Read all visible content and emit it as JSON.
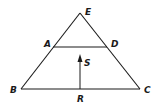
{
  "diagram": {
    "type": "geometry-figure",
    "stroke_color": "#1a1a1a",
    "background": "#ffffff",
    "points": {
      "E": {
        "label": "E",
        "x": 80,
        "y": 13
      },
      "A": {
        "label": "A",
        "x": 53,
        "y": 47
      },
      "D": {
        "label": "D",
        "x": 107,
        "y": 47
      },
      "B": {
        "label": "B",
        "x": 21,
        "y": 89
      },
      "C": {
        "label": "C",
        "x": 140,
        "y": 89
      },
      "R": {
        "label": "R",
        "x": 80,
        "y": 89
      },
      "S": {
        "label": "S"
      }
    },
    "segments": [
      "EB",
      "EC",
      "BC",
      "AD"
    ],
    "arrow": {
      "from": "R",
      "toward": "S",
      "direction": "up"
    }
  }
}
